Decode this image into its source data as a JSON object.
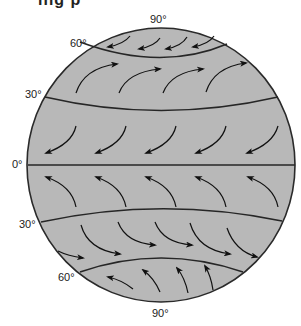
{
  "figure": {
    "type": "global wind belts diagram",
    "cropped_top_text": "ing p",
    "globe": {
      "cx": 161,
      "cy": 165,
      "rx": 134,
      "ry": 137,
      "fill": "#b8b8b8",
      "stroke": "#2a2a2a"
    },
    "labels": [
      {
        "id": "north-pole",
        "text": "90°",
        "x": 150,
        "y": 13
      },
      {
        "id": "north-60",
        "text": "60°",
        "x": 70,
        "y": 37
      },
      {
        "id": "north-30",
        "text": "30°",
        "x": 25,
        "y": 88
      },
      {
        "id": "equator",
        "text": "0°",
        "x": 12,
        "y": 158
      },
      {
        "id": "south-30",
        "text": "30°",
        "x": 19,
        "y": 218
      },
      {
        "id": "south-60",
        "text": "60°",
        "x": 58,
        "y": 271
      },
      {
        "id": "south-pole",
        "text": "90°",
        "x": 152,
        "y": 307
      }
    ],
    "latitude_lines": [
      {
        "id": "lat-60n",
        "from": [
          80,
          42
        ],
        "ctrl": [
          161,
          72
        ],
        "to": [
          227,
          44
        ]
      },
      {
        "id": "lat-30n",
        "from": [
          45,
          97
        ],
        "ctrl": [
          161,
          124
        ],
        "to": [
          278,
          97
        ]
      },
      {
        "id": "equator",
        "from": [
          28,
          165
        ],
        "ctrl": [
          161,
          165
        ],
        "to": [
          295,
          165
        ]
      },
      {
        "id": "lat-30s",
        "from": [
          41,
          222
        ],
        "ctrl": [
          161,
          196
        ],
        "to": [
          282,
          221
        ]
      },
      {
        "id": "lat-60s",
        "from": [
          80,
          272
        ],
        "ctrl": [
          161,
          244
        ],
        "to": [
          243,
          272
        ]
      }
    ],
    "wind_belts": [
      {
        "name": "polar-easterlies-north",
        "arrows": [
          {
            "tail": [
              130,
              36
            ],
            "ctrl": [
              124,
              44
            ],
            "head": [
              108,
              47
            ]
          },
          {
            "tail": [
              160,
              38
            ],
            "ctrl": [
              155,
              46
            ],
            "head": [
              139,
              49
            ]
          },
          {
            "tail": [
              187,
              37
            ],
            "ctrl": [
              182,
              46
            ],
            "head": [
              166,
              49
            ]
          },
          {
            "tail": [
              214,
              36
            ],
            "ctrl": [
              209,
              44
            ],
            "head": [
              193,
              47
            ]
          }
        ]
      },
      {
        "name": "westerlies-north",
        "arrows": [
          {
            "tail": [
              76,
              93
            ],
            "ctrl": [
              84,
              68
            ],
            "head": [
              117,
              64
            ]
          },
          {
            "tail": [
              119,
              93
            ],
            "ctrl": [
              127,
              72
            ],
            "head": [
              160,
              69
            ]
          },
          {
            "tail": [
              163,
              93
            ],
            "ctrl": [
              171,
              72
            ],
            "head": [
              203,
              69
            ]
          },
          {
            "tail": [
              206,
              92
            ],
            "ctrl": [
              214,
              67
            ],
            "head": [
              246,
              63
            ]
          }
        ]
      },
      {
        "name": "northeast-trades",
        "arrows": [
          {
            "tail": [
              76,
              126
            ],
            "ctrl": [
              72,
              144
            ],
            "head": [
              46,
              153
            ]
          },
          {
            "tail": [
              126,
              126
            ],
            "ctrl": [
              122,
              144
            ],
            "head": [
              96,
              153
            ]
          },
          {
            "tail": [
              176,
              126
            ],
            "ctrl": [
              172,
              144
            ],
            "head": [
              146,
              153
            ]
          },
          {
            "tail": [
              226,
              126
            ],
            "ctrl": [
              222,
              144
            ],
            "head": [
              196,
              153
            ]
          },
          {
            "tail": [
              278,
              126
            ],
            "ctrl": [
              273,
              144
            ],
            "head": [
              247,
              153
            ]
          }
        ]
      },
      {
        "name": "southeast-trades",
        "arrows": [
          {
            "tail": [
              76,
              207
            ],
            "ctrl": [
              72,
              186
            ],
            "head": [
              46,
              177
            ]
          },
          {
            "tail": [
              126,
              207
            ],
            "ctrl": [
              122,
              186
            ],
            "head": [
              96,
              177
            ]
          },
          {
            "tail": [
              176,
              207
            ],
            "ctrl": [
              172,
              186
            ],
            "head": [
              146,
              177
            ]
          },
          {
            "tail": [
              226,
              207
            ],
            "ctrl": [
              222,
              186
            ],
            "head": [
              196,
              177
            ]
          },
          {
            "tail": [
              278,
              207
            ],
            "ctrl": [
              274,
              186
            ],
            "head": [
              248,
              177
            ]
          }
        ]
      },
      {
        "name": "westerlies-south",
        "arrows": [
          {
            "tail": [
              58,
              251
            ],
            "ctrl": [
              68,
              256
            ],
            "head": [
              83,
              258
            ]
          },
          {
            "tail": [
              81,
              225
            ],
            "ctrl": [
              88,
              250
            ],
            "head": [
              120,
              254
            ]
          },
          {
            "tail": [
              118,
              222
            ],
            "ctrl": [
              126,
              243
            ],
            "head": [
              155,
              245
            ]
          },
          {
            "tail": [
              155,
              222
            ],
            "ctrl": [
              163,
              243
            ],
            "head": [
              192,
              245
            ]
          },
          {
            "tail": [
              190,
              223
            ],
            "ctrl": [
              198,
              250
            ],
            "head": [
              230,
              254
            ]
          },
          {
            "tail": [
              227,
              228
            ],
            "ctrl": [
              235,
              251
            ],
            "head": [
              257,
              257
            ]
          }
        ]
      },
      {
        "name": "polar-easterlies-south",
        "arrows": [
          {
            "tail": [
              133,
              289
            ],
            "ctrl": [
              122,
              280
            ],
            "head": [
              108,
              277
            ]
          },
          {
            "tail": [
              160,
              292
            ],
            "ctrl": [
              154,
              278
            ],
            "head": [
              143,
              270
            ]
          },
          {
            "tail": [
              188,
              293
            ],
            "ctrl": [
              185,
              278
            ],
            "head": [
              177,
              268
            ]
          },
          {
            "tail": [
              213,
              290
            ],
            "ctrl": [
              211,
              276
            ],
            "head": [
              205,
              266
            ]
          }
        ]
      }
    ]
  }
}
